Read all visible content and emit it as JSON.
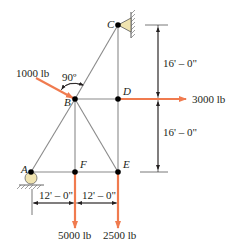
{
  "diagram": {
    "colors": {
      "member": "#8a8a8a",
      "load": "#f07b4f",
      "joint": "#000000",
      "support_fill": "#efe3b0",
      "dimension": "#231f20"
    },
    "nodes": {
      "A": {
        "label": "A",
        "x": 31,
        "y": 172
      },
      "B": {
        "label": "B",
        "x": 75,
        "y": 99
      },
      "C": {
        "label": "C",
        "x": 118,
        "y": 25
      },
      "D": {
        "label": "D",
        "x": 118,
        "y": 99
      },
      "E": {
        "label": "E",
        "x": 118,
        "y": 172
      },
      "F": {
        "label": "F",
        "x": 75,
        "y": 172
      }
    },
    "members": [
      [
        "A",
        "B"
      ],
      [
        "B",
        "C"
      ],
      [
        "C",
        "D"
      ],
      [
        "D",
        "E"
      ],
      [
        "A",
        "F"
      ],
      [
        "F",
        "E"
      ],
      [
        "B",
        "D"
      ],
      [
        "B",
        "F"
      ],
      [
        "B",
        "E"
      ]
    ],
    "supports": {
      "C": "pin-wall",
      "A": "roller-ground"
    },
    "loads": [
      {
        "node": "B",
        "label": "1000 lb",
        "direction": "perpendicular to BC"
      },
      {
        "node": "D",
        "label": "3000 lb",
        "direction": "right"
      },
      {
        "node": "F",
        "label": "5000 lb",
        "direction": "down"
      },
      {
        "node": "E",
        "label": "2500 lb",
        "direction": "down"
      }
    ],
    "angle_label": "90º",
    "dimensions": {
      "vertical_top": "16' – 0\"",
      "vertical_bottom": "16' – 0\"",
      "horizontal_left": "12' – 0\"",
      "horizontal_right": "12' – 0\""
    }
  }
}
